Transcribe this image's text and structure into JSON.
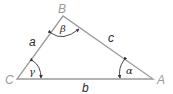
{
  "diagram": {
    "type": "triangle",
    "vertices": [
      {
        "id": "A",
        "label": "A"
      },
      {
        "id": "B",
        "label": "B"
      },
      {
        "id": "C",
        "label": "C"
      }
    ],
    "sides": [
      {
        "id": "a",
        "label": "a",
        "between": "B-C"
      },
      {
        "id": "b",
        "label": "b",
        "between": "C-A"
      },
      {
        "id": "c",
        "label": "c",
        "between": "A-B"
      }
    ],
    "angles": [
      {
        "id": "alpha",
        "label": "α",
        "vertex": "A"
      },
      {
        "id": "beta",
        "label": "β",
        "vertex": "B"
      },
      {
        "id": "gamma",
        "label": "γ",
        "vertex": "C"
      }
    ],
    "colors": {
      "stroke": "#9a9a9a",
      "vertex_label": "#9a9a9a",
      "side_label": "#2a2a2a"
    }
  }
}
